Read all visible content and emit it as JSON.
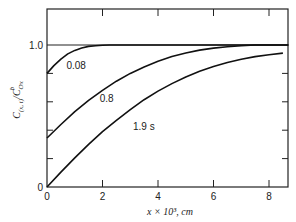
{
  "chart_data": {
    "type": "line",
    "title": "",
    "xlabel": "x × 10³, cm",
    "ylabel": "C(x, t) / C^b_Ox",
    "xlim": [
      0,
      8.7
    ],
    "ylim": [
      0,
      1.25
    ],
    "x_ticks": [
      0,
      2,
      4,
      6,
      8
    ],
    "x_tick_labels": [
      "0",
      "2",
      "4",
      "6",
      "8"
    ],
    "y_ticks": [
      0,
      0.2,
      0.4,
      0.6,
      0.8,
      1.0
    ],
    "y_tick_labels": [
      "0",
      "",
      "",
      "",
      "",
      "1.0"
    ],
    "reference_line": 1.0,
    "grid": false,
    "series": [
      {
        "name": "0.08",
        "label": "0.08",
        "x": [
          0,
          0.25,
          0.5,
          0.75,
          1.0,
          1.25,
          1.5,
          1.75,
          2.0,
          2.25,
          2.5,
          3.0,
          4.0,
          6.0,
          8.7
        ],
        "values": [
          0.8,
          0.855,
          0.9,
          0.937,
          0.962,
          0.979,
          0.99,
          0.995,
          0.998,
          1.0,
          1.0,
          1.0,
          1.0,
          1.0,
          1.0
        ]
      },
      {
        "name": "0.8",
        "label": "0.8",
        "x": [
          0,
          0.5,
          1.0,
          1.5,
          2.0,
          2.5,
          3.0,
          3.5,
          4.0,
          4.5,
          5.0,
          5.5,
          6.0,
          6.5,
          7.0,
          7.5,
          8.7
        ],
        "values": [
          0.345,
          0.44,
          0.53,
          0.61,
          0.68,
          0.745,
          0.8,
          0.845,
          0.885,
          0.918,
          0.944,
          0.964,
          0.978,
          0.988,
          0.995,
          1.0,
          1.0
        ]
      },
      {
        "name": "1.9 s",
        "label": "1.9 s",
        "x": [
          0,
          0.5,
          1.0,
          1.5,
          2.0,
          2.5,
          3.0,
          3.5,
          4.0,
          4.5,
          5.0,
          5.5,
          6.0,
          6.5,
          7.0,
          7.5,
          8.0,
          8.5
        ],
        "values": [
          0.0,
          0.105,
          0.205,
          0.3,
          0.39,
          0.47,
          0.545,
          0.615,
          0.675,
          0.728,
          0.775,
          0.815,
          0.848,
          0.877,
          0.9,
          0.918,
          0.932,
          0.943
        ]
      }
    ],
    "annotations": [
      {
        "text": "0.08",
        "x": 0.7,
        "y": 0.83
      },
      {
        "text": "0.8",
        "x": 1.9,
        "y": 0.6
      },
      {
        "text": "1.9 s",
        "x": 3.1,
        "y": 0.4
      }
    ]
  }
}
